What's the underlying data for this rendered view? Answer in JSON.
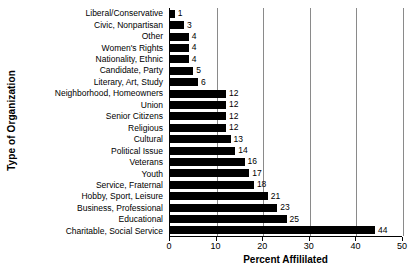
{
  "chart_data": {
    "type": "bar",
    "orientation": "horizontal",
    "title": "",
    "xlabel": "Percent Affililated",
    "ylabel": "Type of Organization",
    "xlim": [
      0,
      50
    ],
    "xticks": [
      0,
      10,
      20,
      30,
      40,
      50
    ],
    "xtick_labels": [
      "0",
      "10",
      "20",
      "30",
      "40",
      "50"
    ],
    "grid": "vertical",
    "legend": "none",
    "bar_color": "#000000",
    "gridline_color": "#8a8a8a",
    "axis_color": "#000000",
    "background_color": "#ffffff",
    "show_value_labels": true,
    "categories": [
      "Liberal/Conservative",
      "Civic, Nonpartisan",
      "Other",
      "Women's Rights",
      "Nationality, Ethnic",
      "Candidate, Party",
      "Literary, Art, Study",
      "Neighborhood, Homeowners",
      "Union",
      "Senior Citizens",
      "Religious",
      "Cultural",
      "Political Issue",
      "Veterans",
      "Youth",
      "Service, Fraternal",
      "Hobby, Sport, Leisure",
      "Business, Professional",
      "Educational",
      "Charitable, Social Service"
    ],
    "values": [
      1,
      3,
      4,
      4,
      4,
      5,
      6,
      12,
      12,
      12,
      12,
      13,
      14,
      16,
      17,
      18,
      21,
      23,
      25,
      44
    ],
    "value_labels": [
      "1",
      "3",
      "4",
      "4",
      "4",
      "5",
      "6",
      "12",
      "12",
      "12",
      "12",
      "13",
      "14",
      "16",
      "17",
      "18",
      "21",
      "23",
      "25",
      "44"
    ]
  }
}
